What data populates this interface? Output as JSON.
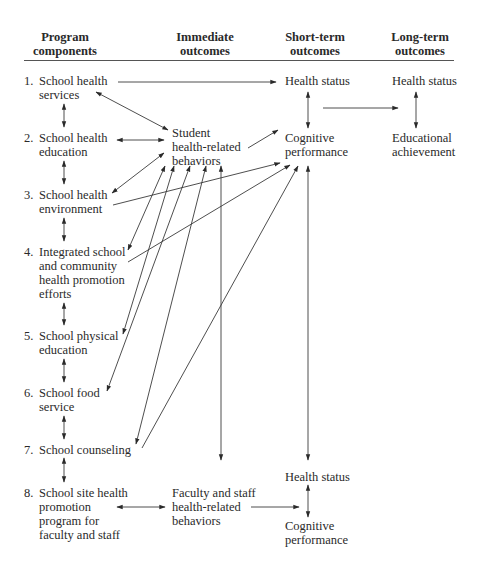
{
  "headers": {
    "program": [
      "Program",
      "components"
    ],
    "immediate": [
      "Immediate",
      "outcomes"
    ],
    "short_term": [
      "Short-term",
      "outcomes"
    ],
    "long_term": [
      "Long-term",
      "outcomes"
    ]
  },
  "program_components": [
    {
      "num": "1.",
      "lines": [
        "School health",
        "services"
      ]
    },
    {
      "num": "2.",
      "lines": [
        "School health",
        "education"
      ]
    },
    {
      "num": "3.",
      "lines": [
        "School health",
        "environment"
      ]
    },
    {
      "num": "4.",
      "lines": [
        "Integrated school",
        "and community",
        "health promotion",
        "efforts"
      ]
    },
    {
      "num": "5.",
      "lines": [
        "School physical",
        "education"
      ]
    },
    {
      "num": "6.",
      "lines": [
        "School food",
        "service"
      ]
    },
    {
      "num": "7.",
      "lines": [
        "School counseling"
      ]
    },
    {
      "num": "8.",
      "lines": [
        "School site health",
        "promotion",
        "program for",
        "faculty and staff"
      ]
    }
  ],
  "immediate_outcomes": {
    "student": [
      "Student",
      "health-related",
      "behaviors"
    ],
    "faculty": [
      "Faculty and staff",
      "health-related",
      "behaviors"
    ]
  },
  "short_term_outcomes": {
    "health_status_top": "Health status",
    "cognitive_top": [
      "Cognitive",
      "performance"
    ],
    "health_status_bottom": "Health status",
    "cognitive_bottom": [
      "Cognitive",
      "performance"
    ]
  },
  "long_term_outcomes": {
    "health_status": "Health status",
    "educational": [
      "Educational",
      "achievement"
    ]
  }
}
